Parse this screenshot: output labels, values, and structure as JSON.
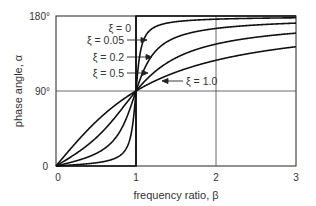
{
  "chart_data": {
    "type": "line",
    "title": "",
    "xlabel": "frequency ratio, β",
    "ylabel": "phase angle, α",
    "xlim": [
      0,
      3
    ],
    "ylim": [
      0,
      180
    ],
    "x_ticks": [
      "0",
      "1",
      "2",
      "3"
    ],
    "y_ticks": [
      "0",
      "90°",
      "180°"
    ],
    "grid": true,
    "formula": "α = atan2(2ξβ, 1 − β²)",
    "series": [
      {
        "name": "ξ = 0",
        "zeta": 0,
        "x": [
          0,
          0.5,
          0.99,
          1.01,
          1.5,
          2,
          3
        ],
        "values": [
          0,
          0,
          0,
          180,
          180,
          180,
          180
        ]
      },
      {
        "name": "ξ = 0.05",
        "zeta": 0.05,
        "x": [
          0,
          0.5,
          0.9,
          1,
          1.1,
          1.5,
          2,
          3
        ],
        "values": [
          0,
          3.8,
          25.3,
          90,
          152.4,
          175.4,
          178.1,
          178.9
        ]
      },
      {
        "name": "ξ = 0.2",
        "zeta": 0.2,
        "x": [
          0,
          0.5,
          0.9,
          1,
          1.1,
          1.5,
          2,
          3
        ],
        "values": [
          0,
          14.9,
          62.5,
          90,
          115.6,
          154.4,
          165.1,
          171.5
        ]
      },
      {
        "name": "ξ = 0.5",
        "zeta": 0.5,
        "x": [
          0,
          0.5,
          0.9,
          1,
          1.1,
          1.5,
          2,
          3
        ],
        "values": [
          0,
          33.7,
          78.1,
          90,
          101.3,
          129.8,
          146.3,
          159.4
        ]
      },
      {
        "name": "ξ = 1.0",
        "zeta": 1.0,
        "x": [
          0,
          0.5,
          0.9,
          1,
          1.1,
          1.5,
          2,
          3
        ],
        "values": [
          0,
          53.1,
          83.9,
          90,
          95.4,
          112.6,
          126.9,
          143.1
        ]
      }
    ],
    "annotations": [
      {
        "text": "ξ = 0",
        "pointer": false
      },
      {
        "text": "ξ = 0.05",
        "pointer": true
      },
      {
        "text": "ξ = 0.2",
        "pointer": true
      },
      {
        "text": "ξ = 0.5",
        "pointer": true
      },
      {
        "text": "ξ = 1.0",
        "pointer": true
      }
    ],
    "reference_lines": [
      {
        "axis": "x",
        "value": 1
      },
      {
        "axis": "y",
        "value": 90
      }
    ]
  },
  "labels": {
    "xlabel": "frequency ratio, β",
    "ylabel": "phase angle, α",
    "x0": "0",
    "x1": "1",
    "x2": "2",
    "x3": "3",
    "y0": "0",
    "y90": "90°",
    "y180": "180°",
    "a0": "ξ = 0",
    "a005": "ξ = 0.05",
    "a02": "ξ = 0.2",
    "a05": "ξ = 0.5",
    "a10": "ξ = 1.0"
  }
}
